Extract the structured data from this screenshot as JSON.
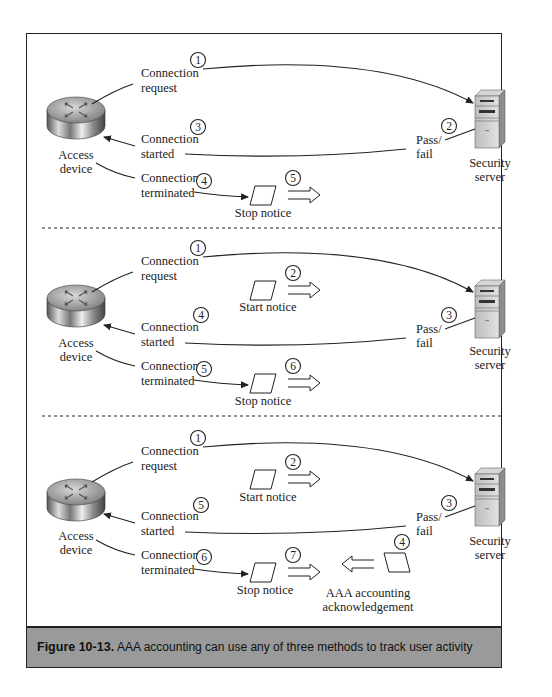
{
  "figure": {
    "number_label": "Figure 10-13.",
    "caption": "AAA accounting can use any of three methods to track user activity"
  },
  "nodes": {
    "access_device_label": [
      "Access",
      "device"
    ],
    "security_server_label": [
      "Security",
      "server"
    ]
  },
  "panels": [
    {
      "connection_request": {
        "lines": [
          "Connection",
          "request"
        ],
        "step": "1"
      },
      "pass_fail": {
        "lines": [
          "Pass/",
          "fail"
        ],
        "step": "2"
      },
      "connection_started": {
        "lines": [
          "Connection",
          "started"
        ],
        "step": "3"
      },
      "connection_terminated": {
        "lines": [
          "Connection",
          "terminated"
        ],
        "step": "4"
      },
      "stop_notice": {
        "label": "Stop notice",
        "step": "5"
      }
    },
    {
      "connection_request": {
        "lines": [
          "Connection",
          "request"
        ],
        "step": "1"
      },
      "start_notice": {
        "label": "Start notice",
        "step": "2"
      },
      "pass_fail": {
        "lines": [
          "Pass/",
          "fail"
        ],
        "step": "3"
      },
      "connection_started": {
        "lines": [
          "Connection",
          "started"
        ],
        "step": "4"
      },
      "connection_terminated": {
        "lines": [
          "Connection",
          "terminated"
        ],
        "step": "5"
      },
      "stop_notice": {
        "label": "Stop notice",
        "step": "6"
      }
    },
    {
      "connection_request": {
        "lines": [
          "Connection",
          "request"
        ],
        "step": "1"
      },
      "start_notice": {
        "label": "Start notice",
        "step": "2"
      },
      "pass_fail": {
        "lines": [
          "Pass/",
          "fail"
        ],
        "step": "3"
      },
      "accounting_ack": {
        "lines": [
          "AAA accounting",
          "acknowledgement"
        ],
        "step": "4"
      },
      "connection_started": {
        "lines": [
          "Connection",
          "started"
        ],
        "step": "5"
      },
      "connection_terminated": {
        "lines": [
          "Connection",
          "terminated"
        ],
        "step": "6"
      },
      "stop_notice": {
        "label": "Stop notice",
        "step": "7"
      }
    }
  ],
  "colors": {
    "caption_bar": "#9a9a9a",
    "frame": "#222222",
    "line": "#222222"
  }
}
